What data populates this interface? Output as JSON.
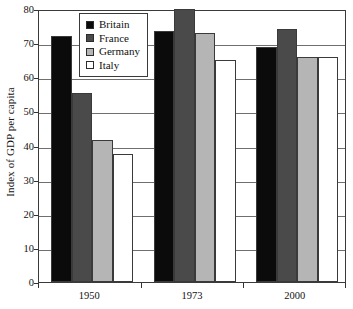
{
  "chart_data": {
    "type": "bar",
    "title": "",
    "subtitle": "",
    "xlabel": "",
    "ylabel": "Index of GDP per capita",
    "categories": [
      "1950",
      "1973",
      "2000"
    ],
    "ylim": [
      0,
      80
    ],
    "yticks": [
      0,
      10,
      20,
      30,
      40,
      50,
      60,
      70,
      80
    ],
    "ytick_labels": [
      "0",
      "10",
      "20",
      "30",
      "40",
      "50",
      "60",
      "70",
      "80"
    ],
    "grid": "horizontal",
    "legend_position": "top-left-inside",
    "series": [
      {
        "name": "Britain",
        "color": "#0b0b0b",
        "values": [
          72,
          73.5,
          69
        ]
      },
      {
        "name": "France",
        "color": "#4a4a4a",
        "values": [
          55.5,
          80,
          74
        ]
      },
      {
        "name": "Germany",
        "color": "#b5b5b5",
        "values": [
          41.5,
          73,
          66
        ]
      },
      {
        "name": "Italy",
        "color": "#ffffff",
        "values": [
          37.5,
          65,
          66
        ]
      }
    ]
  },
  "legend": {
    "items": [
      {
        "label": "Britain",
        "color": "#0b0b0b"
      },
      {
        "label": "France",
        "color": "#4a4a4a"
      },
      {
        "label": "Germany",
        "color": "#b5b5b5"
      },
      {
        "label": "Italy",
        "color": "#ffffff"
      }
    ]
  }
}
